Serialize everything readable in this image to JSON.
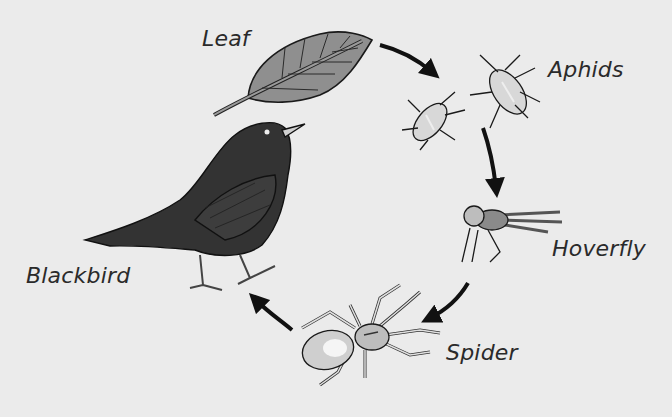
{
  "diagram": {
    "type": "food-web-cycle",
    "organisms": [
      {
        "id": "leaf",
        "label": "Leaf"
      },
      {
        "id": "aphids",
        "label": "Aphids"
      },
      {
        "id": "hoverfly",
        "label": "Hoverfly"
      },
      {
        "id": "spider",
        "label": "Spider"
      },
      {
        "id": "blackbird",
        "label": "Blackbird"
      }
    ],
    "arrows": [
      {
        "from": "Leaf",
        "to": "Aphids"
      },
      {
        "from": "Aphids",
        "to": "Hoverfly"
      },
      {
        "from": "Hoverfly",
        "to": "Spider"
      },
      {
        "from": "Spider",
        "to": "Blackbird"
      }
    ],
    "colors": {
      "background": "#ebebeb",
      "ink": "#111111",
      "leaf_fill": "#8a8a8a",
      "bird_fill": "#333333"
    }
  }
}
